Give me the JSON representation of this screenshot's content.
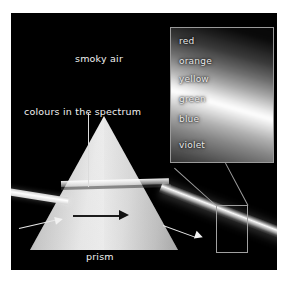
{
  "figure": {
    "background_color": "#ffffff",
    "plate_color": "#000000",
    "accent_color": "#a0a0a0"
  },
  "labels": {
    "smoky_air": "smoky air",
    "colours_in_the_spectrum": "colours in the spectrum",
    "prism": "prism"
  },
  "inset": {
    "caption": "magnified spectrum",
    "spectrum_bands": [
      {
        "name": "red"
      },
      {
        "name": "orange"
      },
      {
        "name": "yellow"
      },
      {
        "name": "green"
      },
      {
        "name": "blue"
      },
      {
        "name": "violet"
      }
    ]
  },
  "annotations": {
    "incoming_beam_arrow": "incoming white light beam",
    "inside_prism_arrow": "light travelling through prism",
    "outgoing_beam_arrow": "dispersed spectrum beam"
  }
}
